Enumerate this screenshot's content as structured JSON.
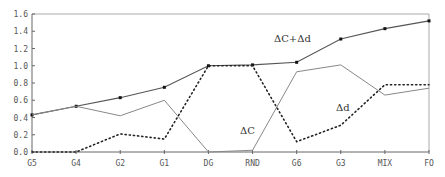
{
  "chart_data": {
    "type": "line",
    "title": "",
    "xlabel": "",
    "ylabel": "",
    "ylim": [
      0,
      1.6
    ],
    "yticks": [
      "0.0",
      "0.2",
      "0.4",
      "0.6",
      "0.8",
      "1.0",
      "1.2",
      "1.4",
      "1.6"
    ],
    "categories": [
      "G5",
      "G4",
      "G2",
      "G1",
      "DG",
      "RND",
      "G6",
      "G3",
      "MIX",
      "FO"
    ],
    "grid": false,
    "legend": "inline annotations",
    "series": [
      {
        "name": "ΔC+Δd",
        "style": "solid-with-markers",
        "values": [
          0.43,
          0.53,
          0.63,
          0.75,
          1.0,
          1.01,
          1.04,
          1.31,
          1.43,
          1.52
        ]
      },
      {
        "name": "ΔC",
        "style": "solid-gray",
        "values": [
          0.43,
          0.53,
          0.42,
          0.6,
          0.0,
          0.02,
          0.93,
          1.01,
          0.66,
          0.74
        ]
      },
      {
        "name": "Δd",
        "style": "dotted",
        "values": [
          0.0,
          0.0,
          0.21,
          0.15,
          1.0,
          1.0,
          0.12,
          0.31,
          0.78,
          0.78
        ]
      }
    ],
    "annotations": [
      {
        "text": "ΔC+Δd",
        "near": "G6-G3",
        "series": "ΔC+Δd"
      },
      {
        "text": "ΔC",
        "near": "RND",
        "series": "ΔC"
      },
      {
        "text": "Δd",
        "near": "G3",
        "series": "Δd"
      }
    ]
  }
}
